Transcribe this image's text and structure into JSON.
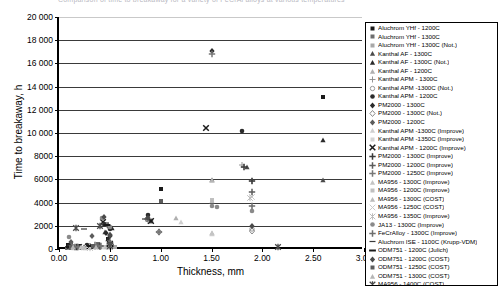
{
  "chart_data": {
    "type": "scatter",
    "title": "Comparison of time to breakaway for a variety of FeCrAl alloys at various temperatures",
    "xlabel": "Thickness, mm",
    "ylabel": "Time to breakaway, h",
    "xlim": [
      0.0,
      3.0
    ],
    "ylim": [
      0,
      20000
    ],
    "xticks": [
      "0.00",
      "0.50",
      "1.00",
      "1.50",
      "2.00",
      "2.50",
      "3.00"
    ],
    "xtick_values": [
      0.0,
      0.5,
      1.0,
      1.5,
      2.0,
      2.5,
      3.0
    ],
    "yticks": [
      "0",
      "2000",
      "4000",
      "6000",
      "8000",
      "10 000",
      "12 000",
      "14 000",
      "16 000",
      "18 000",
      "20 000"
    ],
    "ytick_values": [
      0,
      2000,
      4000,
      6000,
      8000,
      10000,
      12000,
      14000,
      16000,
      18000,
      20000
    ],
    "grid": "horizontal",
    "legend_position": "right",
    "series": [
      {
        "name": "Aluchrom YHf - 1200C",
        "marker": "square",
        "color": "#1a1a1a",
        "points": [
          [
            0.09,
            380
          ],
          [
            0.12,
            560
          ],
          [
            0.2,
            300
          ],
          [
            0.35,
            180
          ],
          [
            0.48,
            900
          ],
          [
            0.5,
            260
          ],
          [
            1.0,
            5150
          ],
          [
            2.6,
            13100
          ]
        ]
      },
      {
        "name": "Aluchrom YHf - 1300C",
        "marker": "square",
        "color": "#6e6e6e",
        "points": [
          [
            0.08,
            120
          ],
          [
            0.1,
            200
          ],
          [
            0.2,
            150
          ],
          [
            0.38,
            430
          ],
          [
            0.5,
            160
          ],
          [
            0.52,
            240
          ]
        ]
      },
      {
        "name": "Aluchrom YHf - 1300C (Not.)",
        "marker": "square",
        "color": "#a8a8a8",
        "points": [
          [
            0.1,
            90
          ],
          [
            0.22,
            110
          ],
          [
            0.4,
            160
          ],
          [
            0.55,
            130
          ]
        ]
      },
      {
        "name": "Kanthal AF - 1300C",
        "marker": "triangle",
        "color": "#4a4a4a",
        "points": [
          [
            0.12,
            260
          ],
          [
            0.3,
            200
          ],
          [
            0.45,
            1500
          ],
          [
            0.5,
            520
          ],
          [
            1.5,
            5950
          ],
          [
            1.85,
            7100
          ],
          [
            2.6,
            5980
          ]
        ]
      },
      {
        "name": "Kanthal AF - 1300C (Not.)",
        "marker": "triangle",
        "color": "#2b2b2b",
        "points": [
          [
            0.1,
            150
          ],
          [
            0.25,
            180
          ],
          [
            0.48,
            900
          ],
          [
            0.52,
            1800
          ],
          [
            2.6,
            9420
          ]
        ]
      },
      {
        "name": "Kanthal AF - 1200C",
        "marker": "triangle",
        "color": "#b0b0b0",
        "points": [
          [
            0.13,
            220
          ],
          [
            0.35,
            280
          ],
          [
            0.5,
            600
          ],
          [
            1.15,
            2700
          ],
          [
            1.5,
            1350
          ]
        ]
      },
      {
        "name": "Kanthal APM - 1300C",
        "marker": "plus-thin",
        "color": "#8a8a8a",
        "points": [
          [
            0.1,
            170
          ],
          [
            0.3,
            210
          ],
          [
            0.5,
            700
          ],
          [
            0.88,
            2400
          ],
          [
            1.8,
            7250
          ],
          [
            1.9,
            5900
          ]
        ]
      },
      {
        "name": "Kanthal APM -1300C (Not.)",
        "marker": "circle-open",
        "color": "#9a9a9a",
        "points": [
          [
            0.12,
            130
          ],
          [
            0.35,
            190
          ],
          [
            0.5,
            450
          ],
          [
            0.98,
            1500
          ],
          [
            1.9,
            1750
          ]
        ]
      },
      {
        "name": "Kanthal APM - 1200C",
        "marker": "dot",
        "color": "#2b2b2b",
        "points": [
          [
            0.1,
            240
          ],
          [
            0.28,
            320
          ],
          [
            0.44,
            2150
          ],
          [
            0.5,
            1700
          ],
          [
            0.88,
            2900
          ],
          [
            1.8,
            10200
          ]
        ]
      },
      {
        "name": "PM2000 - 1300C",
        "marker": "diamond",
        "color": "#2b2b2b",
        "points": [
          [
            0.11,
            200
          ],
          [
            0.3,
            260
          ],
          [
            0.46,
            1400
          ],
          [
            0.5,
            1100
          ],
          [
            0.87,
            2600
          ],
          [
            1.5,
            17050
          ]
        ]
      },
      {
        "name": "PM2000 - 1300C (Not.)",
        "marker": "diamond-open",
        "color": "#8a8a8a",
        "points": [
          [
            0.14,
            150
          ],
          [
            0.4,
            180
          ],
          [
            0.5,
            380
          ],
          [
            0.98,
            1450
          ],
          [
            1.9,
            1550
          ]
        ]
      },
      {
        "name": "PM2000 - 1200C",
        "marker": "diamond",
        "color": "#5c5c5c",
        "points": [
          [
            0.12,
            600
          ],
          [
            0.32,
            1100
          ],
          [
            0.48,
            2000
          ],
          [
            0.5,
            1250
          ],
          [
            0.9,
            2450
          ]
        ]
      },
      {
        "name": "Kanthal APM -1300C (Improve)",
        "marker": "triangle-light",
        "color": "#cfcfcf",
        "points": [
          [
            0.15,
            120
          ],
          [
            0.42,
            160
          ],
          [
            0.5,
            310
          ],
          [
            1.2,
            2300
          ],
          [
            1.5,
            1300
          ]
        ]
      },
      {
        "name": "Kanthal APM -1350C (Improve)",
        "marker": "square-light",
        "color": "#d4d4d4",
        "points": [
          [
            0.17,
            100
          ],
          [
            0.45,
            140
          ],
          [
            0.5,
            220
          ]
        ]
      },
      {
        "name": "Kanthal APM - 1200C (Improve)",
        "marker": "x-bold",
        "color": "#1a1a1a",
        "points": [
          [
            0.2,
            170
          ],
          [
            0.43,
            2350
          ],
          [
            0.5,
            420
          ],
          [
            0.9,
            2400
          ],
          [
            1.45,
            10450
          ]
        ]
      },
      {
        "name": "PM2000 - 1300C (Improve)",
        "marker": "plus-bold",
        "color": "#3a3a3a",
        "points": [
          [
            0.18,
            190
          ],
          [
            0.4,
            250
          ],
          [
            0.5,
            500
          ],
          [
            1.82,
            7100
          ],
          [
            1.9,
            5900
          ]
        ]
      },
      {
        "name": "PM2000 - 1200C (Improve)",
        "marker": "plus-bold",
        "color": "#5c5c5c",
        "points": [
          [
            0.16,
            210
          ],
          [
            0.38,
            280
          ],
          [
            0.5,
            430
          ],
          [
            1.9,
            4900
          ]
        ]
      },
      {
        "name": "PM2000 - 1250C (Improve)",
        "marker": "plus-bold",
        "color": "#777777",
        "points": [
          [
            0.19,
            160
          ],
          [
            0.41,
            300
          ],
          [
            0.5,
            350
          ],
          [
            1.5,
            16850
          ]
        ]
      },
      {
        "name": "MA956 - 1300C (Improve)",
        "marker": "triangle-light",
        "color": "#c4c4c4",
        "points": [
          [
            0.22,
            140
          ],
          [
            0.46,
            200
          ],
          [
            0.5,
            270
          ],
          [
            1.5,
            1350
          ]
        ]
      },
      {
        "name": "MA956 - 1200C (Improve)",
        "marker": "square-light",
        "color": "#c0c0c0",
        "points": [
          [
            0.24,
            120
          ],
          [
            0.47,
            180
          ],
          [
            0.5,
            240
          ],
          [
            1.5,
            4200
          ]
        ]
      },
      {
        "name": "MA956 - 1300C (COST)",
        "marker": "triangle-light",
        "color": "#bbbbbb",
        "points": [
          [
            0.26,
            110
          ],
          [
            0.48,
            170
          ],
          [
            0.5,
            210
          ],
          [
            1.5,
            4150
          ]
        ]
      },
      {
        "name": "MA956 - 1250C (COST)",
        "marker": "x-light",
        "color": "#c9c9c9",
        "points": [
          [
            0.28,
            130
          ],
          [
            0.49,
            160
          ],
          [
            0.5,
            200
          ],
          [
            1.9,
            4450
          ]
        ]
      },
      {
        "name": "MA956 - 1350C (Improve)",
        "marker": "star-light",
        "color": "#bdbdbd",
        "points": [
          [
            0.3,
            100
          ],
          [
            0.5,
            150
          ],
          [
            1.88,
            4400
          ]
        ]
      },
      {
        "name": "JA13 - 1300C (Improve)",
        "marker": "dot",
        "color": "#8a8a8a",
        "points": [
          [
            0.1,
            1000
          ],
          [
            0.42,
            2700
          ],
          [
            0.5,
            1900
          ],
          [
            0.87,
            2550
          ],
          [
            1.5,
            3700
          ],
          [
            1.55,
            3650
          ],
          [
            1.9,
            3250
          ]
        ]
      },
      {
        "name": "FeCrAlloy - 1300C (Improve)",
        "marker": "plus-bold",
        "color": "#6e6e6e",
        "points": [
          [
            0.13,
            250
          ],
          [
            0.35,
            330
          ],
          [
            0.5,
            480
          ],
          [
            0.98,
            1500
          ],
          [
            1.9,
            3700
          ]
        ]
      },
      {
        "name": "Aluchrom ISE - 1100C (Krupp-VDM)",
        "marker": "dash",
        "color": "#3a3a3a",
        "points": [
          [
            0.25,
            1700
          ],
          [
            0.46,
            2250
          ],
          [
            0.5,
            500
          ],
          [
            0.85,
            2600
          ]
        ]
      },
      {
        "name": "ODM751 - 1200C (Julich)",
        "marker": "dash-bold",
        "color": "#1a1a1a",
        "points": [
          [
            0.1,
            160
          ],
          [
            0.3,
            220
          ],
          [
            0.47,
            2100
          ],
          [
            0.5,
            300
          ]
        ]
      },
      {
        "name": "ODM751 - 1200C (COST)",
        "marker": "diamond",
        "color": "#4a4a4a",
        "points": [
          [
            0.44,
            2800
          ],
          [
            0.5,
            1250
          ],
          [
            0.88,
            2650
          ],
          [
            1.9,
            2000
          ]
        ]
      },
      {
        "name": "ODM751 - 1250C (COST)",
        "marker": "square",
        "color": "#5c5c5c",
        "points": [
          [
            0.12,
            180
          ],
          [
            0.33,
            240
          ],
          [
            0.5,
            330
          ],
          [
            1.0,
            4100
          ]
        ]
      },
      {
        "name": "ODM751 - 1300C (COST)",
        "marker": "triangle-light",
        "color": "#b5b5b5",
        "points": [
          [
            0.14,
            140
          ],
          [
            0.36,
            200
          ],
          [
            0.5,
            260
          ],
          [
            1.5,
            5950
          ]
        ]
      },
      {
        "name": "MA956 - 1400C (COST)",
        "marker": "star-bold",
        "color": "#4a4a4a",
        "points": [
          [
            0.17,
            1800
          ],
          [
            0.4,
            1950
          ],
          [
            0.5,
            280
          ],
          [
            2.15,
            150
          ]
        ]
      }
    ]
  },
  "axes": {
    "y_title": "Time to breakaway, h",
    "x_title": "Thickness, mm"
  },
  "legend": {
    "entries": [
      {
        "label": "Aluchrom YHf - 1200C",
        "marker": "square",
        "color": "#1a1a1a"
      },
      {
        "label": "Aluchrom YHf - 1300C",
        "marker": "square",
        "color": "#6e6e6e"
      },
      {
        "label": "Aluchrom YHf - 1300C (Not.)",
        "marker": "square",
        "color": "#a8a8a8"
      },
      {
        "label": "Kanthal AF - 1300C",
        "marker": "triangle",
        "color": "#4a4a4a"
      },
      {
        "label": "Kanthal AF - 1300C (Not.)",
        "marker": "triangle",
        "color": "#2b2b2b"
      },
      {
        "label": "Kanthal AF - 1200C",
        "marker": "triangle",
        "color": "#b0b0b0"
      },
      {
        "label": "Kanthal APM - 1300C",
        "marker": "plus-thin",
        "color": "#8a8a8a"
      },
      {
        "label": "Kanthal APM -1300C (Not.)",
        "marker": "circle-open",
        "color": "#9a9a9a"
      },
      {
        "label": "Kanthal APM - 1200C",
        "marker": "dot",
        "color": "#2b2b2b"
      },
      {
        "label": "PM2000 - 1300C",
        "marker": "diamond",
        "color": "#2b2b2b"
      },
      {
        "label": "PM2000 - 1300C (Not.)",
        "marker": "diamond-open",
        "color": "#8a8a8a"
      },
      {
        "label": "PM2000 - 1200C",
        "marker": "diamond",
        "color": "#5c5c5c"
      },
      {
        "label": "Kanthal APM -1300C (Improve)",
        "marker": "triangle-light",
        "color": "#cfcfcf"
      },
      {
        "label": "Kanthal APM -1350C (Improve)",
        "marker": "square-light",
        "color": "#d4d4d4"
      },
      {
        "label": "Kanthal APM - 1200C (Improve)",
        "marker": "x-bold",
        "color": "#1a1a1a"
      },
      {
        "label": "PM2000 - 1300C (Improve)",
        "marker": "plus-bold",
        "color": "#3a3a3a"
      },
      {
        "label": "PM2000 - 1200C (Improve)",
        "marker": "plus-bold",
        "color": "#5c5c5c"
      },
      {
        "label": "PM2000 - 1250C (Improve)",
        "marker": "plus-bold",
        "color": "#777777"
      },
      {
        "label": "MA956 - 1300C (Improve)",
        "marker": "triangle-light",
        "color": "#c4c4c4"
      },
      {
        "label": "MA956 - 1200C (Improve)",
        "marker": "square-light",
        "color": "#c0c0c0"
      },
      {
        "label": "MA956 - 1300C (COST)",
        "marker": "triangle-light",
        "color": "#bbbbbb"
      },
      {
        "label": "MA956 - 1250C (COST)",
        "marker": "x-light",
        "color": "#c9c9c9"
      },
      {
        "label": "MA956 - 1350C (Improve)",
        "marker": "star-light",
        "color": "#bdbdbd"
      },
      {
        "label": "JA13 - 1300C (Improve)",
        "marker": "dot",
        "color": "#8a8a8a"
      },
      {
        "label": "FeCrAlloy - 1300C (Improve)",
        "marker": "plus-bold",
        "color": "#6e6e6e"
      },
      {
        "label": "Aluchrom ISE - 1100C (Krupp-VDM)",
        "marker": "dash",
        "color": "#3a3a3a"
      },
      {
        "label": "ODM751 - 1200C (Julich)",
        "marker": "dash-bold",
        "color": "#1a1a1a"
      },
      {
        "label": "ODM751 - 1200C (COST)",
        "marker": "diamond",
        "color": "#4a4a4a"
      },
      {
        "label": "ODM751 - 1250C (COST)",
        "marker": "square",
        "color": "#5c5c5c"
      },
      {
        "label": "ODM751 - 1300C (COST)",
        "marker": "triangle-light",
        "color": "#b5b5b5"
      },
      {
        "label": "MA956 - 1400C (COST)",
        "marker": "star-bold",
        "color": "#4a4a4a"
      }
    ]
  }
}
